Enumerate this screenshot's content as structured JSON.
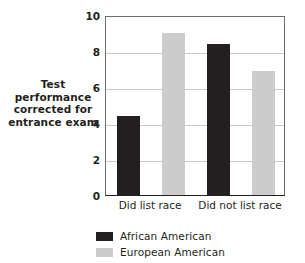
{
  "chart_data": {
    "type": "bar",
    "title": "",
    "subtitle": "",
    "xlabel": "",
    "ylabel": "Test performance corrected for entrance exam",
    "ylabel_lines": [
      "Test",
      "performance",
      "corrected for",
      "entrance exam"
    ],
    "categories": [
      "Did list race",
      "Did not list race"
    ],
    "series": [
      {
        "name": "African American",
        "color": "#231f20",
        "values": [
          4.4,
          8.4
        ]
      },
      {
        "name": "European American",
        "color": "#cccccc",
        "values": [
          9.0,
          6.9
        ]
      }
    ],
    "ylim": [
      0,
      10
    ],
    "yticks": [
      0,
      2,
      4,
      6,
      8,
      10
    ],
    "ytick_labels": [
      "0",
      "2",
      "4",
      "6",
      "8",
      "10"
    ],
    "grid": true,
    "grid_axis": "y",
    "legend_position": "bottom",
    "legend": [
      {
        "label": "African American",
        "swatch": "dark-swatch",
        "color": "#231f20"
      },
      {
        "label": "European American",
        "swatch": "light-swatch",
        "color": "#cccccc"
      }
    ]
  },
  "colors": {
    "background": "#ffffff",
    "text": "#231f20",
    "gridline": "#c9cacb",
    "axis": "#6d6e71",
    "series_dark": "#231f20",
    "series_light": "#cccccc"
  }
}
